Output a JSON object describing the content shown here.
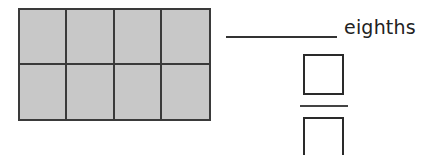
{
  "model": {
    "rows": 2,
    "columns": 4,
    "total_parts": 8,
    "shaded_parts": 8,
    "fill_color": "#c8c8c8",
    "line_color": "#3a3a3a"
  },
  "answer": {
    "blank_value": "",
    "unit_label": "eighths"
  },
  "fraction": {
    "numerator": "",
    "denominator": ""
  }
}
